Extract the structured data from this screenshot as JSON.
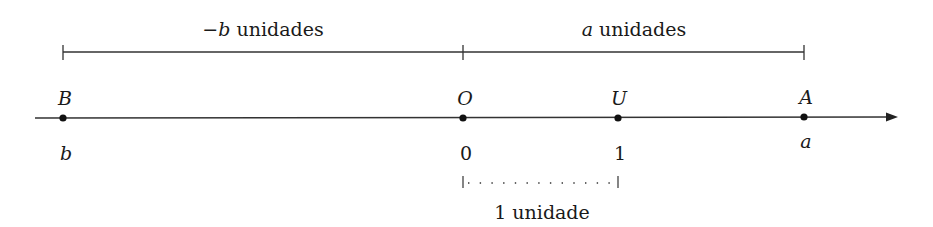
{
  "diagram": {
    "type": "number-line",
    "axis": {
      "y": 118,
      "x_start": 35,
      "x_end": 898,
      "color": "#333333"
    },
    "points": [
      {
        "name": "B",
        "value_label": "b",
        "x": 63
      },
      {
        "name": "O",
        "value_label": "0",
        "x": 463
      },
      {
        "name": "U",
        "value_label": "1",
        "x": 618
      },
      {
        "name": "A",
        "value_label": "a",
        "x": 804
      }
    ],
    "brackets": {
      "negative": {
        "var": "−b",
        "text": " unidades",
        "x1": 63,
        "x2": 463
      },
      "positive": {
        "var": "a",
        "text": " unidades",
        "x1": 463,
        "x2": 804
      },
      "unit": {
        "text": "1 unidade",
        "x1": 463,
        "x2": 618
      }
    }
  }
}
